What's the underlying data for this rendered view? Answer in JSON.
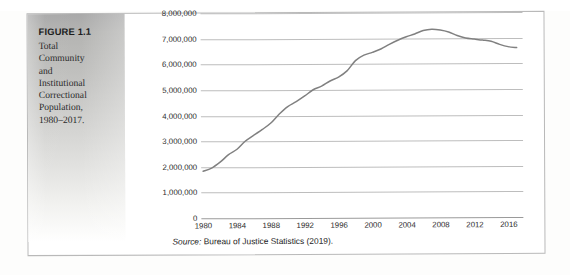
{
  "figure": {
    "label": "FIGURE 1.1",
    "caption": "Total Community and Institutional Correctional Population, 1980–2017."
  },
  "source": {
    "prefix": "Source:",
    "text": " Bureau of Justice Statistics (2019)."
  },
  "colors": {
    "line": "#808080",
    "gridline": "#bdbdbd",
    "axis": "#9a9a9a",
    "panel_top": "#a9a9a9",
    "panel_bottom": "#ffffff",
    "border": "#b9b9b9",
    "text": "#2c2c2c"
  },
  "chart_data": {
    "type": "line",
    "title": "",
    "xlabel": "",
    "ylabel": "",
    "grid": true,
    "legend": false,
    "xlim": [
      1980,
      2017
    ],
    "ylim": [
      0,
      8000000
    ],
    "ytick_labels": [
      "8,000,000",
      "7,000,000",
      "6,000,000",
      "5,000,000",
      "4,000,000",
      "3,000,000",
      "2,000,000",
      "1,000,000",
      "0"
    ],
    "ytick_values": [
      8000000,
      7000000,
      6000000,
      5000000,
      4000000,
      3000000,
      2000000,
      1000000,
      0
    ],
    "xtick_labels": [
      "1980",
      "1984",
      "1988",
      "1992",
      "1996",
      "2000",
      "2004",
      "2008",
      "2012",
      "2016"
    ],
    "xtick_values": [
      1980,
      1984,
      1988,
      1992,
      1996,
      2000,
      2004,
      2008,
      2012,
      2016
    ],
    "series": [
      {
        "name": "Total Community and Institutional Correctional Population",
        "x": [
          1980,
          1981,
          1982,
          1983,
          1984,
          1985,
          1986,
          1987,
          1988,
          1989,
          1990,
          1991,
          1992,
          1993,
          1994,
          1995,
          1996,
          1997,
          1998,
          1999,
          2000,
          2001,
          2002,
          2003,
          2004,
          2005,
          2006,
          2007,
          2008,
          2009,
          2010,
          2011,
          2012,
          2013,
          2014,
          2015,
          2016,
          2017
        ],
        "values": [
          1840000,
          1960000,
          2190000,
          2480000,
          2690000,
          3010000,
          3240000,
          3460000,
          3710000,
          4060000,
          4350000,
          4540000,
          4760000,
          5000000,
          5140000,
          5340000,
          5490000,
          5730000,
          6130000,
          6340000,
          6450000,
          6580000,
          6760000,
          6920000,
          7050000,
          7160000,
          7290000,
          7340000,
          7310000,
          7230000,
          7090000,
          6990000,
          6950000,
          6910000,
          6860000,
          6740000,
          6650000,
          6610000
        ]
      }
    ]
  }
}
